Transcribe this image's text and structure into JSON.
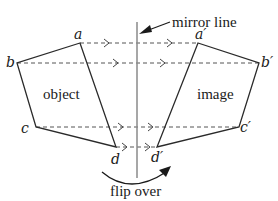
{
  "diagram": {
    "title_label": "mirror line",
    "object_label": "object",
    "image_label": "image",
    "flip_label": "flip over",
    "vertices": {
      "object": [
        {
          "name": "a",
          "label": "a"
        },
        {
          "name": "b",
          "label": "b"
        },
        {
          "name": "c",
          "label": "c"
        },
        {
          "name": "d",
          "label": "d"
        }
      ],
      "image": [
        {
          "name": "a-prime",
          "label": "a′"
        },
        {
          "name": "b-prime",
          "label": "b′"
        },
        {
          "name": "c-prime",
          "label": "c′"
        },
        {
          "name": "d-prime",
          "label": "d′"
        }
      ]
    },
    "colors": {
      "shape": "#2a2a2a",
      "mirror": "#8a8a8a",
      "dashed": "#555555"
    }
  }
}
